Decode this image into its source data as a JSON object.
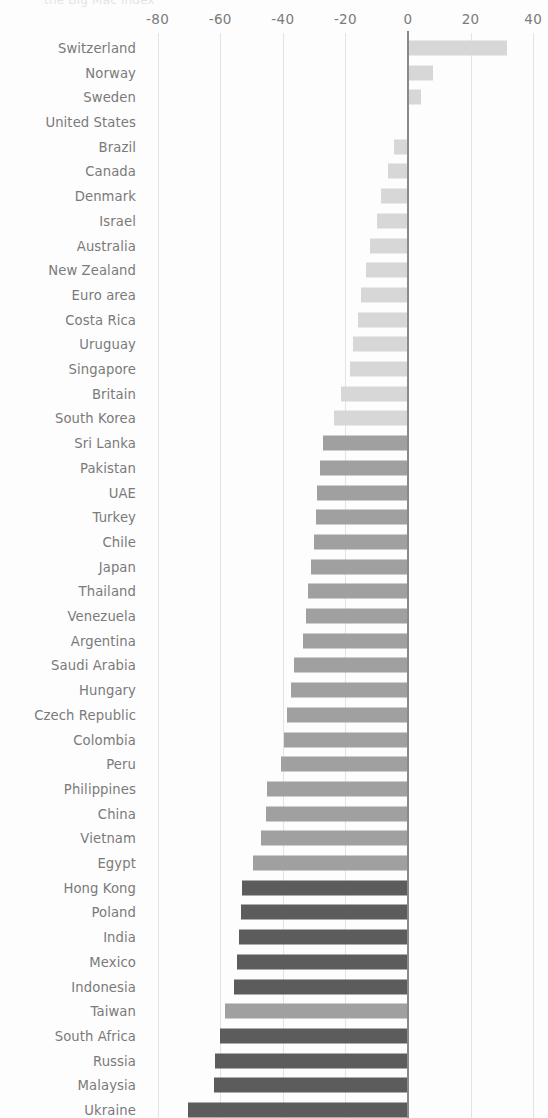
{
  "title": "the Big Mac index",
  "axis": {
    "ticks": [
      -80,
      -60,
      -40,
      -20,
      0,
      20,
      40
    ],
    "tick_labels": [
      "-80",
      "-60",
      "-40",
      "-20",
      "0",
      "20",
      "40"
    ],
    "min": -88,
    "max": 44
  },
  "colors": {
    "light": "#d7d7d7",
    "medium": "#a0a0a0",
    "dark": "#5c5c5c",
    "zero_line": "#8a8a8a",
    "gridline": "#e3e3e3",
    "text": "#7a7a7a"
  },
  "chart_data": {
    "type": "bar",
    "orientation": "horizontal",
    "title": "the Big Mac index",
    "xlabel": "",
    "ylabel": "",
    "xlim": [
      -88,
      44
    ],
    "grid": true,
    "legend": "none",
    "categories": [
      "Switzerland",
      "Norway",
      "Sweden",
      "United States",
      "Brazil",
      "Canada",
      "Denmark",
      "Israel",
      "Australia",
      "New Zealand",
      "Euro area",
      "Costa Rica",
      "Uruguay",
      "Singapore",
      "Britain",
      "South Korea",
      "Sri Lanka",
      "Pakistan",
      "UAE",
      "Turkey",
      "Chile",
      "Japan",
      "Thailand",
      "Venezuela",
      "Argentina",
      "Saudi Arabia",
      "Hungary",
      "Czech Republic",
      "Colombia",
      "Peru",
      "Philippines",
      "China",
      "Vietnam",
      "Egypt",
      "Hong Kong",
      "Poland",
      "India",
      "Mexico",
      "Indonesia",
      "Taiwan",
      "South Africa",
      "Russia",
      "Malaysia",
      "Ukraine"
    ],
    "values": [
      31.7,
      8.0,
      4.0,
      0.0,
      -4.5,
      -6.5,
      -8.5,
      -10.0,
      -12.0,
      -13.5,
      -15.0,
      -16.0,
      -17.5,
      -18.5,
      -21.5,
      -23.5,
      -27.0,
      -28.0,
      -29.0,
      -29.5,
      -30.0,
      -31.0,
      -32.0,
      -32.5,
      -33.5,
      -36.5,
      -37.5,
      -38.5,
      -39.5,
      -40.5,
      -45.2,
      -45.5,
      -47.0,
      -49.6,
      -53.0,
      -53.5,
      -54.0,
      -54.5,
      -55.5,
      -58.5,
      -60.0,
      -61.7,
      -62.0,
      -70.4
    ],
    "bar_shades": [
      "light",
      "light",
      "light",
      "light",
      "light",
      "light",
      "light",
      "light",
      "light",
      "light",
      "light",
      "light",
      "light",
      "light",
      "light",
      "light",
      "medium",
      "medium",
      "medium",
      "medium",
      "medium",
      "medium",
      "medium",
      "medium",
      "medium",
      "medium",
      "medium",
      "medium",
      "medium",
      "medium",
      "medium",
      "medium",
      "medium",
      "medium",
      "dark",
      "dark",
      "dark",
      "dark",
      "dark",
      "medium",
      "dark",
      "dark",
      "dark",
      "dark"
    ]
  }
}
